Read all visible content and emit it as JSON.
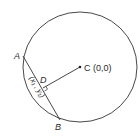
{
  "diagram": {
    "points": {
      "A": {
        "label": "A"
      },
      "B": {
        "label": "B"
      },
      "C": {
        "label": "C (0,0)"
      },
      "D": {
        "label": "D"
      }
    },
    "segment_label": "(x₁ , y₁)",
    "colors": {
      "stroke": "#333333",
      "background": "#ffffff"
    }
  }
}
